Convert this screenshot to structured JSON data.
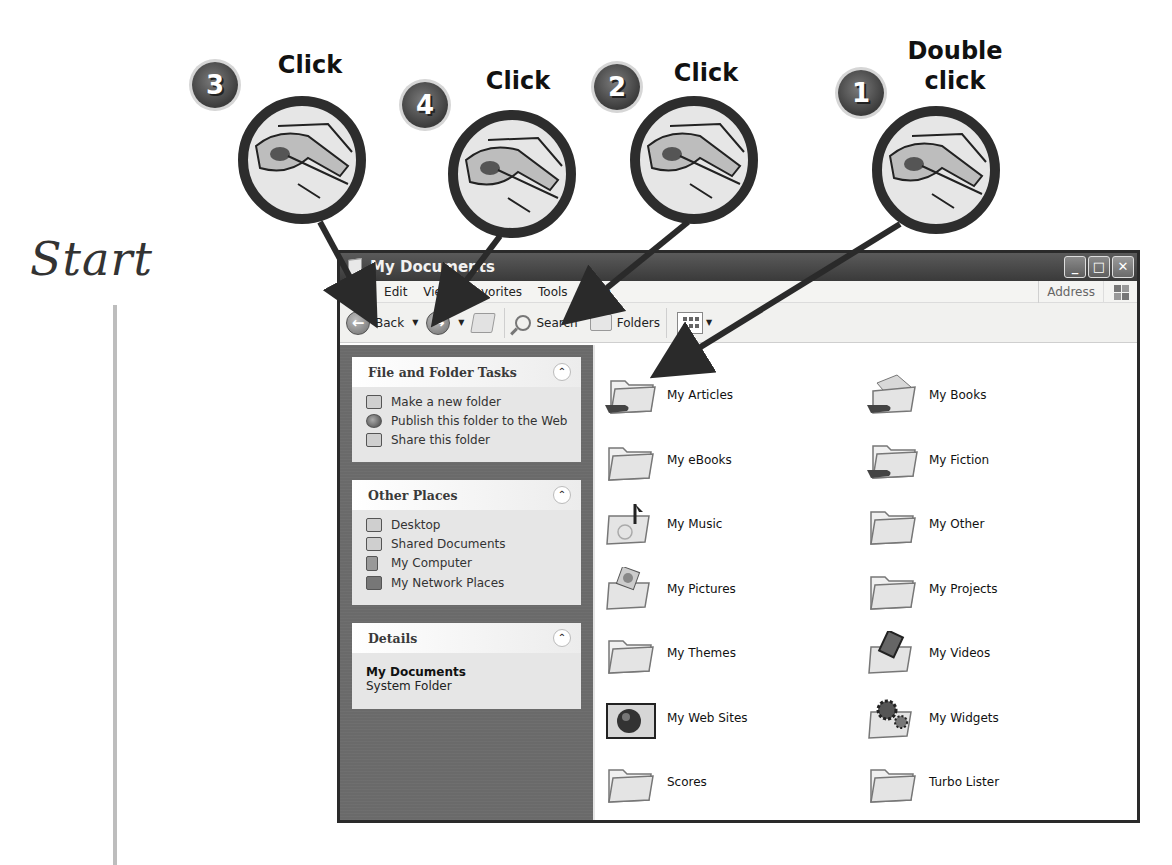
{
  "tutorial": {
    "start_label": "Start",
    "steps": [
      {
        "number": "1",
        "action": "Double click",
        "target": "My Articles folder"
      },
      {
        "number": "2",
        "action": "Click",
        "target": "Up button"
      },
      {
        "number": "3",
        "action": "Click",
        "target": "Back button"
      },
      {
        "number": "4",
        "action": "Click",
        "target": "Back dropdown arrow"
      }
    ],
    "labels": {
      "step1_line1": "Double",
      "step1_line2": "click",
      "step2": "Click",
      "step3": "Click",
      "step4": "Click"
    }
  },
  "window": {
    "title": "My Documents",
    "controls": {
      "minimize": "_",
      "maximize": "□",
      "close": "✕"
    }
  },
  "menubar": {
    "items": [
      "File",
      "Edit",
      "View",
      "Favorites",
      "Tools",
      "Help"
    ],
    "address_label": "Address"
  },
  "toolbar": {
    "back_label": "Back",
    "search_label": "Search",
    "folders_label": "Folders"
  },
  "taskpane": {
    "file_folder_tasks": {
      "title": "File and Folder Tasks",
      "items": [
        "Make a new folder",
        "Publish this folder to the Web",
        "Share this folder"
      ]
    },
    "other_places": {
      "title": "Other Places",
      "items": [
        "Desktop",
        "Shared Documents",
        "My Computer",
        "My Network Places"
      ]
    },
    "details": {
      "title": "Details",
      "name": "My Documents",
      "type": "System Folder"
    }
  },
  "folders": [
    {
      "name": "My Articles",
      "icon": "shared-folder"
    },
    {
      "name": "My Books",
      "icon": "shared-folder-books"
    },
    {
      "name": "My eBooks",
      "icon": "folder"
    },
    {
      "name": "My Fiction",
      "icon": "shared-folder"
    },
    {
      "name": "My Music",
      "icon": "music-folder"
    },
    {
      "name": "My Other",
      "icon": "folder"
    },
    {
      "name": "My Pictures",
      "icon": "pictures-folder"
    },
    {
      "name": "My Projects",
      "icon": "folder"
    },
    {
      "name": "My Themes",
      "icon": "folder"
    },
    {
      "name": "My Videos",
      "icon": "videos-folder"
    },
    {
      "name": "My Web Sites",
      "icon": "web-folder"
    },
    {
      "name": "My Widgets",
      "icon": "widgets-folder"
    },
    {
      "name": "Scores",
      "icon": "folder"
    },
    {
      "name": "Turbo Lister",
      "icon": "folder"
    }
  ]
}
